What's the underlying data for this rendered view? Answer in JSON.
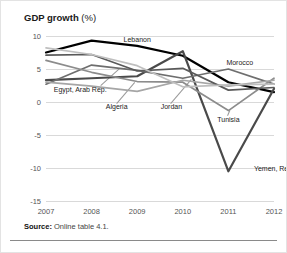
{
  "title": {
    "main": "GDP growth",
    "unit": "(%)"
  },
  "source": {
    "label": "Source:",
    "text": "Online table 4.1."
  },
  "colors": {
    "lebanon": "#000000",
    "yemen": "#4a4a4a",
    "morocco": "#6e6e6e",
    "tunisia": "#8c8c8c",
    "algeria": "#a6a6a6",
    "egypt": "#595959",
    "jordan": "#bfbfbf",
    "grid": "#d9d9d9",
    "text": "#555555"
  },
  "chart_data": {
    "type": "line",
    "title": "GDP growth (%)",
    "xlabel": "",
    "ylabel": "",
    "x": [
      2007,
      2008,
      2009,
      2010,
      2011,
      2012
    ],
    "xticklabels": [
      "2007",
      "2008",
      "2009",
      "2010",
      "2011",
      "2012"
    ],
    "yticks": [
      10,
      5,
      0,
      -5,
      -10,
      -15
    ],
    "yticklabels": [
      "10",
      "5",
      "0",
      "-5",
      "-10",
      "-15"
    ],
    "ylim": [
      -15,
      10
    ],
    "grid": true,
    "legend": "inline-labels",
    "series": [
      {
        "name": "Lebanon",
        "values": [
          7.5,
          9.3,
          8.5,
          7.0,
          3.0,
          1.5
        ]
      },
      {
        "name": "Yemen, Rep.",
        "values": [
          3.3,
          3.6,
          3.9,
          7.7,
          -10.5,
          2.0
        ]
      },
      {
        "name": "Morocco",
        "values": [
          2.7,
          5.6,
          4.8,
          3.6,
          5.0,
          2.7
        ]
      },
      {
        "name": "Tunisia",
        "values": [
          6.3,
          4.5,
          3.1,
          3.0,
          -1.3,
          3.6
        ]
      },
      {
        "name": "Algeria",
        "values": [
          3.0,
          2.4,
          1.6,
          3.3,
          2.4,
          3.3
        ]
      },
      {
        "name": "Egypt, Arab Rep.",
        "values": [
          7.1,
          7.2,
          4.7,
          5.1,
          1.8,
          2.2
        ]
      },
      {
        "name": "Jordan",
        "values": [
          8.2,
          7.2,
          5.5,
          2.3,
          2.6,
          2.7
        ]
      }
    ],
    "annotations": [
      {
        "name": "Lebanon",
        "x": 2009.0,
        "y": 9.6
      },
      {
        "name": "Morocco",
        "x": 2011.25,
        "y": 6.1
      },
      {
        "name": "Egypt, Arab Rep.",
        "x": 2007.75,
        "y": 2.0
      },
      {
        "name": "Algeria",
        "x": 2008.55,
        "y": -0.6
      },
      {
        "name": "Jordan",
        "x": 2009.75,
        "y": -0.6
      },
      {
        "name": "Tunisia",
        "x": 2011.0,
        "y": -2.6
      },
      {
        "name": "Yemen, Rep.",
        "x": 2012.0,
        "y": -10.0
      }
    ]
  }
}
